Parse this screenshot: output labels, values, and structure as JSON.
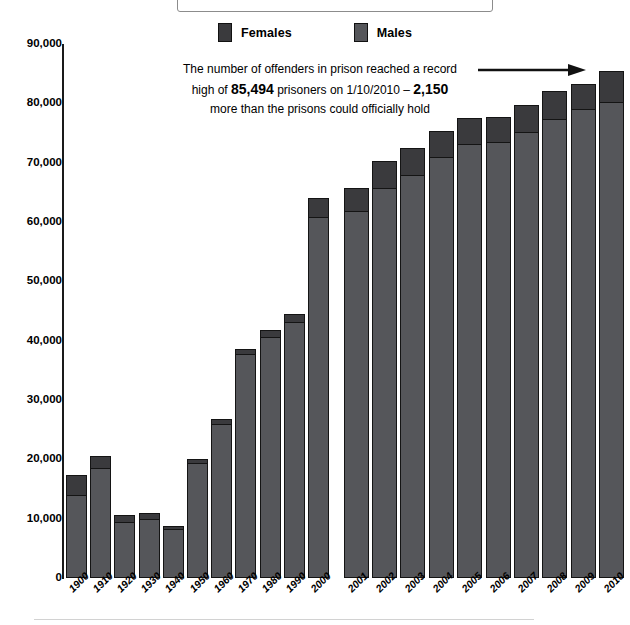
{
  "title": {
    "text": "Prison population in England and Wales"
  },
  "legend": {
    "position": "top-center",
    "items": [
      {
        "label": "Females",
        "color": "#3a3a3d",
        "name": "legend-females"
      },
      {
        "label": "Males",
        "color": "#55565a",
        "name": "legend-males"
      }
    ]
  },
  "annotation": {
    "line1_a": "The number of offenders in prison reached a record",
    "line2_a": "high of ",
    "line2_b": "85,494",
    "line2_c": " prisoners on 1/10/2010 – ",
    "line2_d": "2,150",
    "line3_a": "more than the prisons could officially hold",
    "arrow_icon": "arrow-right-icon"
  },
  "chart_data": {
    "type": "bar",
    "title": "Prison population in England and Wales",
    "xlabel": "",
    "ylabel": "",
    "ylim": [
      0,
      90000
    ],
    "ytick_labels": [
      "90,000",
      "80,000",
      "70,000",
      "60,000",
      "50,000",
      "40,000",
      "30,000",
      "20,000",
      "10,000",
      "0"
    ],
    "ytick_values": [
      90000,
      80000,
      70000,
      60000,
      50000,
      40000,
      30000,
      20000,
      10000,
      0
    ],
    "grid": false,
    "stacked": true,
    "legend_position": "top-center",
    "categories": [
      "1900",
      "1910",
      "1920",
      "1930",
      "1940",
      "1950",
      "1960",
      "1970",
      "1980",
      "1990",
      "2000",
      "2001",
      "2002",
      "2003",
      "2004",
      "2005",
      "2006",
      "2007",
      "2008",
      "2009",
      "2010"
    ],
    "group_break_after": "2000",
    "series": [
      {
        "name": "Males",
        "color": "#55565a",
        "values": [
          14000,
          18600,
          9400,
          10000,
          8300,
          19400,
          26000,
          37800,
          40600,
          43200,
          60900,
          61900,
          65800,
          67900,
          70900,
          73100,
          73500,
          75200,
          77400,
          79000,
          80300
        ]
      },
      {
        "name": "Females",
        "color": "#3a3a3d",
        "values": [
          3300,
          2000,
          1300,
          1000,
          500,
          600,
          800,
          800,
          1200,
          1300,
          3100,
          3800,
          4400,
          4600,
          4400,
          4400,
          4200,
          4500,
          4600,
          4200,
          5200
        ]
      }
    ],
    "totals": [
      17300,
      20600,
      10700,
      11000,
      8800,
      20000,
      26800,
      38600,
      41800,
      44500,
      64000,
      65700,
      70200,
      72500,
      75300,
      77500,
      77700,
      79700,
      82000,
      83200,
      85500
    ],
    "annotations": [
      {
        "text": "The number of offenders in prison reached a record high of 85,494 prisoners on 1/10/2010 – 2,150 more than the prisons could officially hold",
        "target": "2010",
        "arrow": "right"
      }
    ]
  }
}
